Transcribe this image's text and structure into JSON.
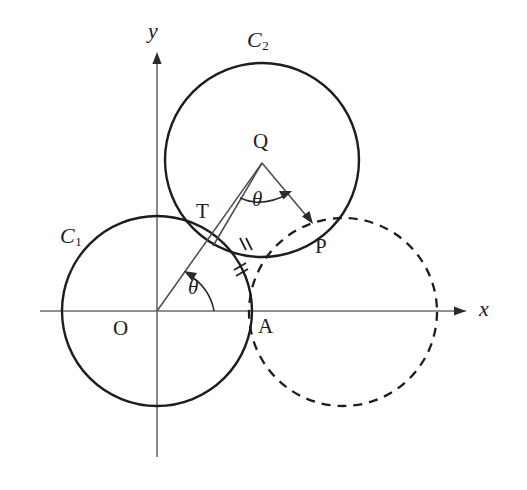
{
  "figure": {
    "axes": {
      "x_label": "x",
      "y_label": "y",
      "origin_label": "O",
      "x_axis_color": "#5a5a5a",
      "y_axis_color": "#5a5a5a"
    },
    "curve_color": "#1d1d1d",
    "ray_color": "#4a4a4a",
    "labels": {
      "circle1": "C",
      "circle1_sub": "1",
      "circle2": "C",
      "circle2_sub": "2",
      "point_q": "Q",
      "point_t": "T",
      "point_p": "P",
      "point_a": "A",
      "angle_origin": "θ",
      "angle_q": "θ"
    },
    "geometry": {
      "origin": {
        "x": 157,
        "y": 311
      },
      "circle1": {
        "cx": 157,
        "cy": 311,
        "r": 95,
        "style": "solid"
      },
      "circle2": {
        "cx": 262,
        "cy": 160,
        "r": 97,
        "style": "solid"
      },
      "circle_dashed": {
        "cx": 343,
        "cy": 312,
        "r": 94,
        "style": "dashed"
      },
      "point_t": {
        "x": 211,
        "y": 233
      },
      "point_p": {
        "x": 311,
        "y": 222
      },
      "point_a": {
        "x": 252,
        "y": 311
      },
      "x_axis": {
        "x1": 40,
        "y1": 311,
        "x2": 470,
        "y2": 311
      },
      "y_axis": {
        "x1": 157,
        "y1": 455,
        "x2": 157,
        "y2": 50
      },
      "tick_marks": [
        {
          "x": 245,
          "y": 244,
          "label": "double-tick-arc-c2"
        },
        {
          "x": 242,
          "y": 272,
          "label": "double-tick-arc-c1"
        }
      ]
    }
  }
}
